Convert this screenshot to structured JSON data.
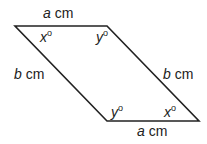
{
  "diagram": {
    "type": "parallelogram",
    "vertices": {
      "top_left": [
        15,
        26
      ],
      "top_right": [
        107,
        26
      ],
      "bottom_right": [
        199,
        121
      ],
      "bottom_left": [
        107,
        121
      ]
    },
    "stroke_color": "#222222",
    "sides": {
      "top": {
        "var": "a",
        "unit": " cm"
      },
      "bottom": {
        "var": "a",
        "unit": " cm"
      },
      "left": {
        "var": "b",
        "unit": " cm"
      },
      "right": {
        "var": "b",
        "unit": " cm"
      }
    },
    "angles": {
      "top_left": {
        "var": "x",
        "deg": "o"
      },
      "top_right": {
        "var": "y",
        "deg": "o"
      },
      "bottom_left": {
        "var": "y",
        "deg": "o"
      },
      "bottom_right": {
        "var": "x",
        "deg": "o"
      }
    }
  }
}
